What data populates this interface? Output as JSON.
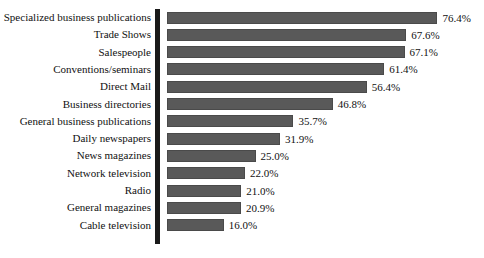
{
  "chart_data": {
    "type": "bar",
    "orientation": "horizontal",
    "title": "",
    "subtitle": "",
    "xlabel": "",
    "ylabel": "",
    "grid": false,
    "legend": false,
    "xlim": [
      0,
      80
    ],
    "value_suffix": "%",
    "categories": [
      "Specialized business publications",
      "Trade Shows",
      "Salespeople",
      "Conventions/seminars",
      "Direct Mail",
      "Business directories",
      "General business publications",
      "Daily newspapers",
      "News magazines",
      "Network television",
      "Radio",
      "General magazines",
      "Cable television"
    ],
    "values": [
      76.4,
      67.6,
      67.1,
      61.4,
      56.4,
      46.8,
      35.7,
      31.9,
      25.0,
      22.0,
      21.0,
      20.9,
      16.0
    ],
    "value_labels": [
      "76.4%",
      "67.6%",
      "67.1%",
      "61.4%",
      "56.4%",
      "46.8%",
      "35.7%",
      "31.9%",
      "25.0%",
      "22.0%",
      "21.0%",
      "20.9%",
      "16.0%"
    ],
    "colors": {
      "bar_fill": "#595959",
      "bar_border": "#4a4a4a",
      "axis": "#1a1a1a",
      "background": "#ffffff",
      "text": "#111111"
    }
  }
}
